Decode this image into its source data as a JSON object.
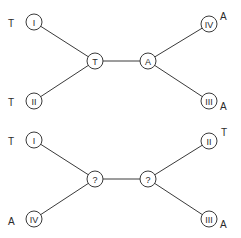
{
  "colors": {
    "line": "#3a3a3a",
    "text": "#2a2a2a",
    "background": "#ffffff"
  },
  "trees": [
    {
      "name": "top-tree",
      "leaves": [
        {
          "id": "I",
          "label": "I",
          "state": "T",
          "x": 34,
          "y": 22,
          "state_x": 8,
          "state_y": 23,
          "anchor": "start"
        },
        {
          "id": "II",
          "label": "II",
          "state": "T",
          "x": 34,
          "y": 101,
          "state_x": 8,
          "state_y": 102,
          "anchor": "start"
        },
        {
          "id": "IV",
          "label": "IV",
          "state": "A",
          "x": 209,
          "y": 24,
          "state_x": 220,
          "state_y": 16,
          "anchor": "start"
        },
        {
          "id": "III",
          "label": "III",
          "state": "A",
          "x": 209,
          "y": 101,
          "state_x": 220,
          "state_y": 106,
          "anchor": "start"
        }
      ],
      "internal": [
        {
          "id": "left",
          "label": "T",
          "x": 95,
          "y": 61
        },
        {
          "id": "right",
          "label": "A",
          "x": 148,
          "y": 61
        }
      ]
    },
    {
      "name": "bottom-tree",
      "leaves": [
        {
          "id": "I",
          "label": "I",
          "state": "T",
          "x": 34,
          "y": 140,
          "state_x": 8,
          "state_y": 141,
          "anchor": "start"
        },
        {
          "id": "IV",
          "label": "IV",
          "state": "A",
          "x": 34,
          "y": 219,
          "state_x": 8,
          "state_y": 221,
          "anchor": "start"
        },
        {
          "id": "II",
          "label": "II",
          "state": "T",
          "x": 209,
          "y": 141,
          "state_x": 221,
          "state_y": 132,
          "anchor": "start"
        },
        {
          "id": "III",
          "label": "III",
          "state": "A",
          "x": 209,
          "y": 219,
          "state_x": 220,
          "state_y": 224,
          "anchor": "start"
        }
      ],
      "internal": [
        {
          "id": "left",
          "label": "?",
          "x": 95,
          "y": 179
        },
        {
          "id": "right",
          "label": "?",
          "x": 148,
          "y": 179
        }
      ]
    }
  ]
}
